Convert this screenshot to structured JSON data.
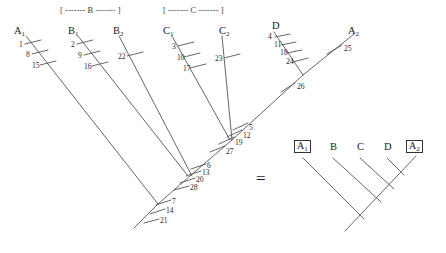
{
  "figure": {
    "equals_symbol": "=",
    "stroke_color": "#4a4a4a",
    "text_color": "#2b2b2b"
  },
  "left_tree": {
    "brackets": [
      {
        "text": "[ ------- B ------- ]",
        "x": 60,
        "y": 7
      },
      {
        "text": "[ ------- C ------- ]",
        "x": 163,
        "y": 7
      }
    ],
    "taxa": [
      {
        "name": "A",
        "sub": "1",
        "x": 14,
        "y": 26
      },
      {
        "name": "B",
        "sub": "1",
        "x": 68,
        "y": 26
      },
      {
        "name": "B",
        "sub": "2",
        "x": 113,
        "y": 26
      },
      {
        "name": "C",
        "sub": "1",
        "x": 163,
        "y": 26
      },
      {
        "name": "C",
        "sub": "2",
        "x": 219,
        "y": 26
      },
      {
        "name": "D",
        "sub": "",
        "x": 272,
        "y": 22
      },
      {
        "name": "A",
        "sub": "2",
        "x": 348,
        "y": 26
      }
    ],
    "tick_numbers": [
      {
        "value": "1",
        "x": 19,
        "y": 41
      },
      {
        "value": "8",
        "x": 26,
        "y": 51
      },
      {
        "value": "15",
        "x": 33,
        "y": 62
      },
      {
        "value": "2",
        "x": 71,
        "y": 41
      },
      {
        "value": "9",
        "x": 78,
        "y": 52
      },
      {
        "value": "16",
        "x": 85,
        "y": 63
      },
      {
        "value": "22",
        "x": 119,
        "y": 53
      },
      {
        "value": "3",
        "x": 172,
        "y": 43
      },
      {
        "value": "10",
        "x": 177,
        "y": 53
      },
      {
        "value": "17",
        "x": 183,
        "y": 64
      },
      {
        "value": "23",
        "x": 216,
        "y": 55
      },
      {
        "value": "4",
        "x": 269,
        "y": 34
      },
      {
        "value": "11",
        "x": 274,
        "y": 42
      },
      {
        "value": "18",
        "x": 280,
        "y": 50
      },
      {
        "value": "24",
        "x": 286,
        "y": 58
      },
      {
        "value": "25",
        "x": 343,
        "y": 45
      },
      {
        "value": "26",
        "x": 294,
        "y": 85
      },
      {
        "value": "5",
        "x": 245,
        "y": 127
      },
      {
        "value": "12",
        "x": 242,
        "y": 135
      },
      {
        "value": "19",
        "x": 233,
        "y": 143
      },
      {
        "value": "27",
        "x": 223,
        "y": 151
      },
      {
        "value": "6",
        "x": 202,
        "y": 166
      },
      {
        "value": "13",
        "x": 200,
        "y": 174
      },
      {
        "value": "20",
        "x": 193,
        "y": 181
      },
      {
        "value": "28",
        "x": 187,
        "y": 189
      },
      {
        "value": "7",
        "x": 170,
        "y": 203
      },
      {
        "value": "14",
        "x": 166,
        "y": 212
      },
      {
        "value": "21",
        "x": 159,
        "y": 222
      }
    ]
  },
  "right_tree": {
    "taxa": [
      {
        "name": "A",
        "sub": "1",
        "boxed": true,
        "x": 296,
        "y": 144
      },
      {
        "name": "B",
        "sub": "",
        "boxed": false,
        "x": 330,
        "y": 145
      },
      {
        "name": "C",
        "sub": "",
        "boxed": false,
        "x": 357,
        "y": 145
      },
      {
        "name": "D",
        "sub": "",
        "boxed": false,
        "x": 384,
        "y": 145
      },
      {
        "name": "A",
        "sub": "2",
        "boxed": true,
        "x": 408,
        "y": 144
      }
    ]
  }
}
